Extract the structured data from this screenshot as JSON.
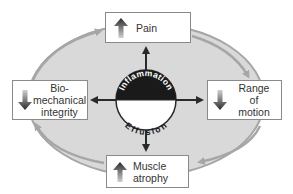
{
  "diagram": {
    "center": {
      "top_label": "Inflammation",
      "bottom_label": "Effusion",
      "top_color": "#1a1a1a",
      "bottom_color": "#ffffff"
    },
    "nodes": [
      {
        "id": "pain",
        "label": "Pain",
        "direction": "up"
      },
      {
        "id": "range-of-motion",
        "label": "Range of motion",
        "lines": [
          "Range",
          "of",
          "motion"
        ],
        "direction": "down"
      },
      {
        "id": "muscle-atrophy",
        "label": "Muscle atrophy",
        "lines": [
          "Muscle",
          "atrophy"
        ],
        "direction": "up"
      },
      {
        "id": "biomechanical-integrity",
        "label": "Bio-mechanical integrity",
        "lines": [
          "Bio-",
          "mechanical",
          "integrity"
        ],
        "direction": "down"
      }
    ],
    "cycle_direction": "clockwise",
    "colors": {
      "ellipse_fill": "#d9d9d9",
      "cycle_arrow": "#a6a6a6",
      "connector": "#2a2a2a",
      "box_border": "#8a8a8a"
    }
  }
}
